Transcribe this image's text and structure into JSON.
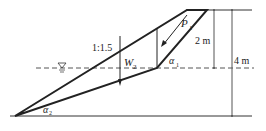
{
  "diagram": {
    "title": "",
    "labels": {
      "slope_ratio": "1:1.5",
      "force_p": "P",
      "force_p_sub": "1",
      "weight_w": "W",
      "weight_w_sub": "2",
      "angle_a1": "α",
      "angle_a1_sub": "1",
      "angle_a2": "α",
      "angle_a2_sub": "2",
      "dim_2m": "2 m",
      "dim_4m": "4 m",
      "water_symbol": "▽"
    },
    "colors": {
      "line": "#222222",
      "dim": "#555555"
    }
  }
}
